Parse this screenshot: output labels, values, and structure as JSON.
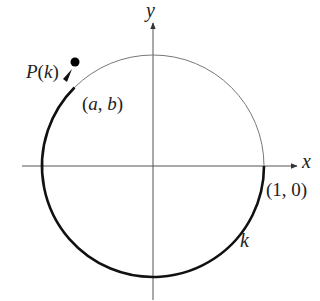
{
  "diagram": {
    "type": "unit-circle-arc",
    "axes": {
      "x_label": "x",
      "y_label": "y"
    },
    "point": {
      "name": "P(k)",
      "coords": "(a, b)"
    },
    "start_point": "(1, 0)",
    "arc_label": "k",
    "colors": {
      "axis": "#555555",
      "circle": "#777777",
      "arc": "#111111",
      "point": "#000000"
    }
  },
  "labels": {
    "y": "y",
    "x": "x",
    "P": "P",
    "Pk_open": "(",
    "Pk_k": "k",
    "Pk_close": ")",
    "ab_open": "(",
    "ab_a": "a",
    "ab_comma": ", ",
    "ab_b": "b",
    "ab_close": ")",
    "one_zero": "(1, 0)",
    "k": "k"
  }
}
